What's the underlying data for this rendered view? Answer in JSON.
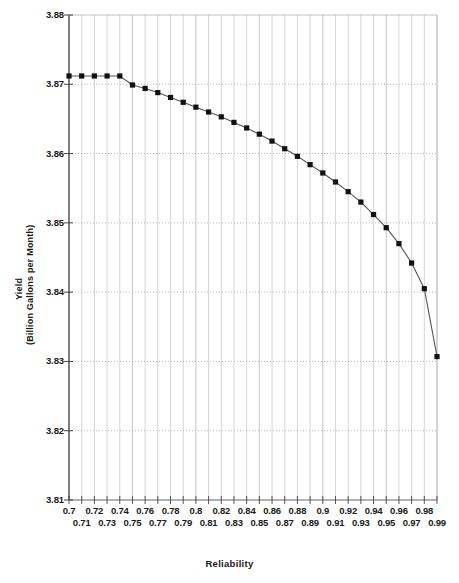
{
  "chart_data": {
    "type": "line",
    "title": "",
    "xlabel": "Reliability",
    "ylabel": "Yield",
    "ylabel_units": "(Billion Gallons per Month)",
    "xlim": [
      0.7,
      0.99
    ],
    "ylim": [
      3.81,
      3.88
    ],
    "grid": true,
    "legend": "none",
    "marker": "filled-square",
    "line_color": "#555555",
    "marker_color": "#111111",
    "ytick_labels": [
      "3.88",
      "3.87",
      "3.86",
      "3.85",
      "3.84",
      "3.83",
      "3.82",
      "3.81"
    ],
    "ytick_values": [
      3.88,
      3.87,
      3.86,
      3.85,
      3.84,
      3.83,
      3.82,
      3.81
    ],
    "xtick_labels": [
      "0.7",
      "0.71",
      "0.72",
      "0.73",
      "0.74",
      "0.75",
      "0.76",
      "0.77",
      "0.78",
      "0.79",
      "0.8",
      "0.81",
      "0.82",
      "0.83",
      "0.84",
      "0.85",
      "0.86",
      "0.87",
      "0.88",
      "0.89",
      "0.9",
      "0.91",
      "0.92",
      "0.93",
      "0.94",
      "0.95",
      "0.96",
      "0.97",
      "0.98",
      "0.99"
    ],
    "x": [
      0.7,
      0.71,
      0.72,
      0.73,
      0.74,
      0.75,
      0.76,
      0.77,
      0.78,
      0.79,
      0.8,
      0.81,
      0.82,
      0.83,
      0.84,
      0.85,
      0.86,
      0.87,
      0.88,
      0.89,
      0.9,
      0.91,
      0.92,
      0.93,
      0.94,
      0.95,
      0.96,
      0.97,
      0.98,
      0.99
    ],
    "values": [
      3.8712,
      3.8712,
      3.8712,
      3.8712,
      3.8712,
      3.8699,
      3.8694,
      3.8688,
      3.8681,
      3.8674,
      3.8667,
      3.866,
      3.8653,
      3.8645,
      3.8637,
      3.8628,
      3.8618,
      3.8607,
      3.8596,
      3.8584,
      3.8572,
      3.8559,
      3.8545,
      3.853,
      3.8512,
      3.8493,
      3.847,
      3.8442,
      3.8405,
      3.8307
    ]
  },
  "axes": {
    "y_title_line1": "Yield",
    "y_title_line2": "(Billion Gallons per Month)",
    "x_title": "Reliability"
  }
}
